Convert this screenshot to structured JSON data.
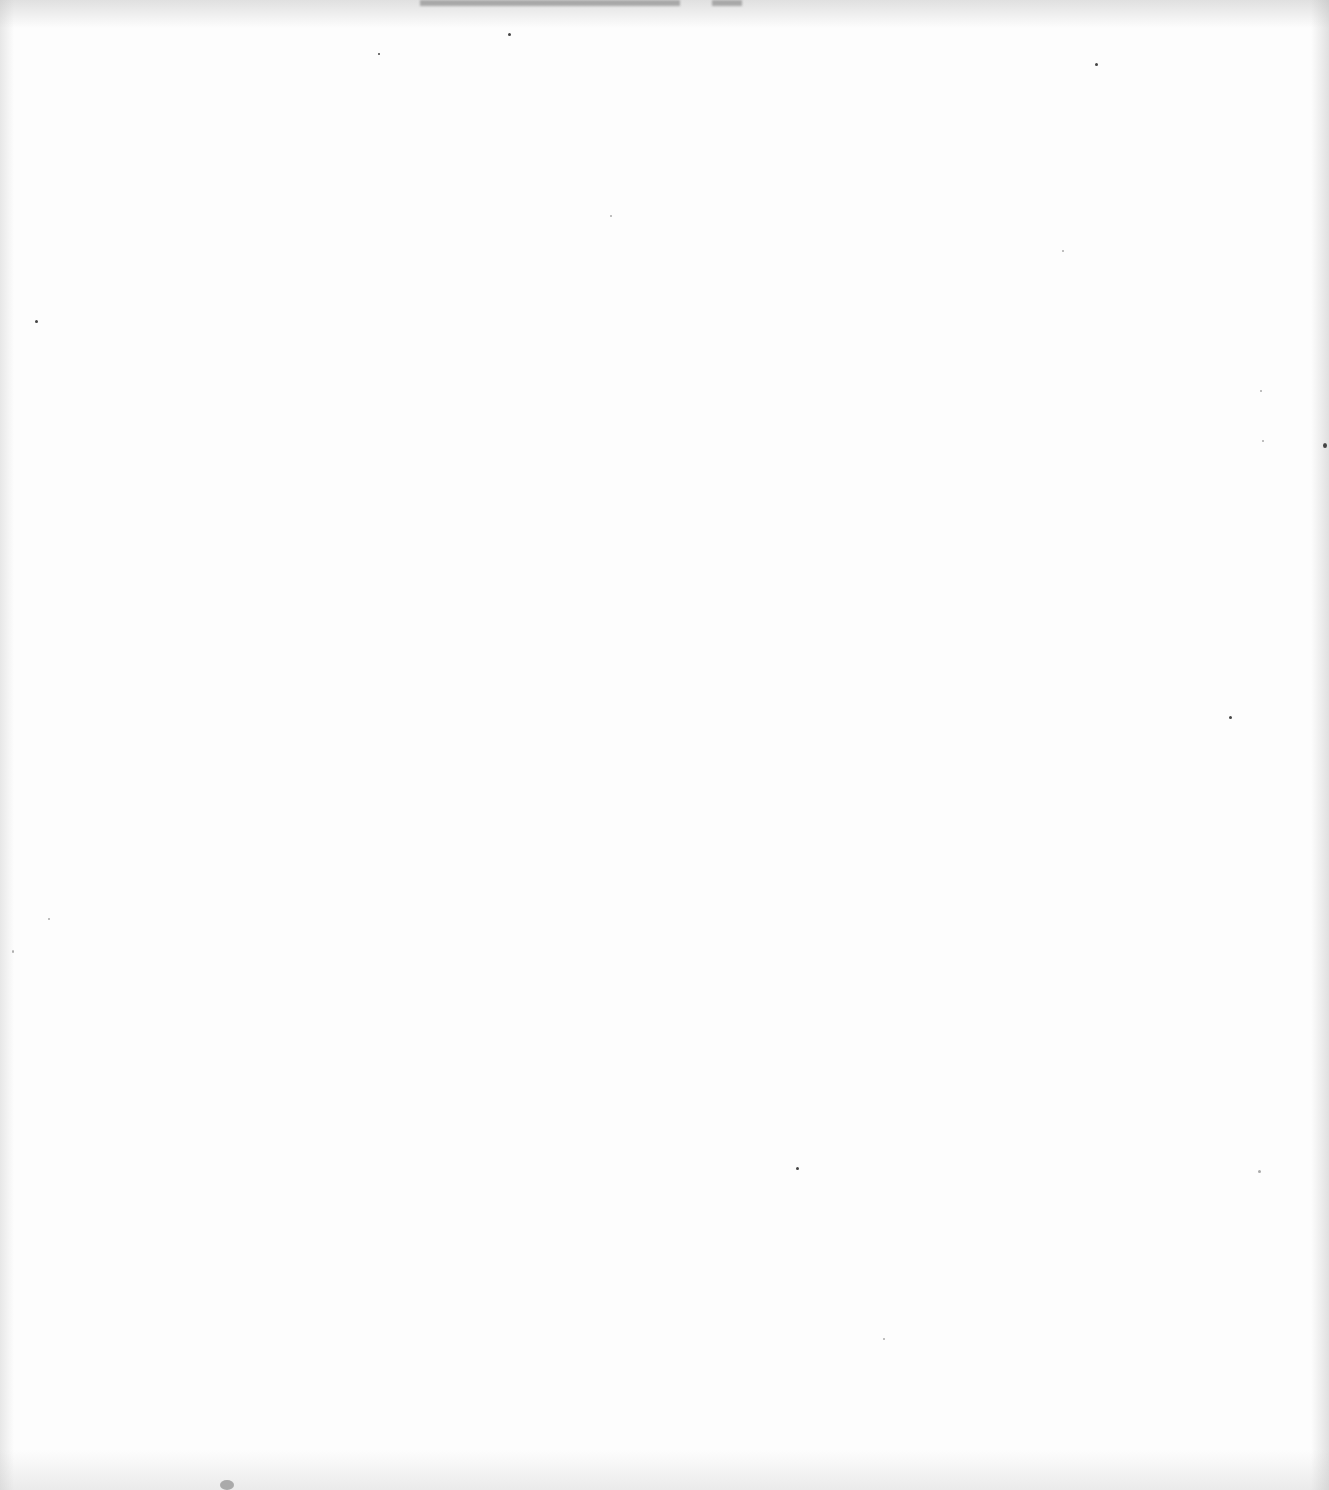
{
  "document": {
    "type": "blank-scanned-page",
    "text": ""
  }
}
